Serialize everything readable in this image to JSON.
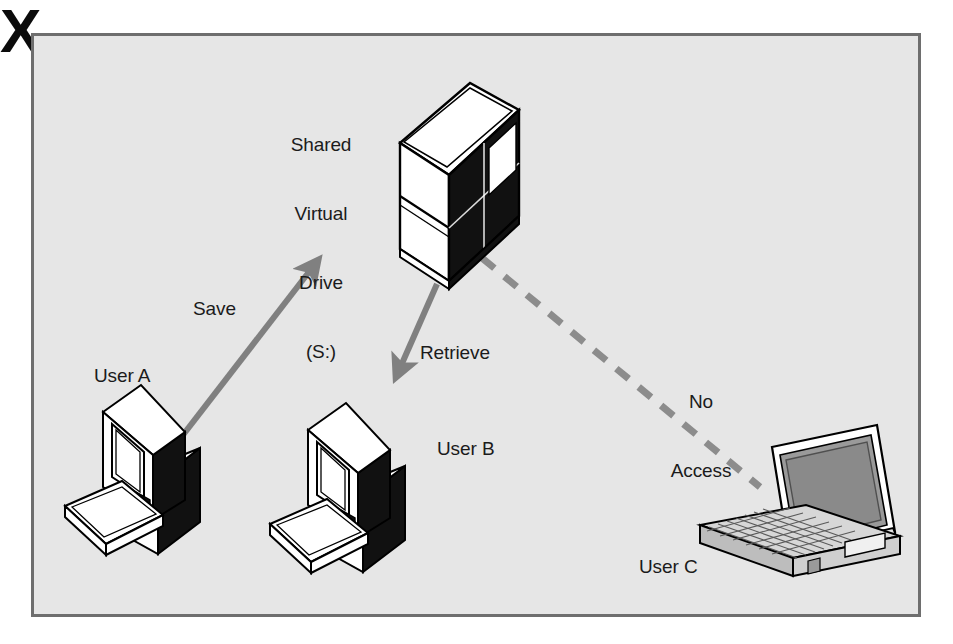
{
  "figure": {
    "background_color": "#e6e6e6",
    "border_color": "#6e6e6e",
    "page_color": "#ffffff",
    "arrow_color": "#808080",
    "dashed_color": "#8c8c8c",
    "text_color": "#1b1b1b",
    "block_color": "#000000"
  },
  "labels": {
    "drive": "Shared\nVirtual\nDrive\n(S:)",
    "drive_line1": "Shared",
    "drive_line2": "Virtual",
    "drive_line3": "Drive",
    "drive_line4": "(S:)",
    "save": "Save",
    "retrieve": "Retrieve",
    "user_a": "User A",
    "user_b": "User B",
    "user_c": "User C",
    "no_access": "No\nAccess",
    "no_access_line1": "No",
    "no_access_line2": "Access",
    "blocked_marker": "X"
  },
  "nodes": [
    {
      "id": "shared-drive",
      "name": "Shared Virtual Drive (S:)",
      "icon": "server-cabinet-icon",
      "x": 470,
      "y": 180
    },
    {
      "id": "user-a",
      "name": "User A",
      "icon": "desktop-computer-icon",
      "x": 160,
      "y": 500
    },
    {
      "id": "user-b",
      "name": "User B",
      "icon": "desktop-computer-icon",
      "x": 350,
      "y": 500
    },
    {
      "id": "user-c",
      "name": "User C",
      "icon": "laptop-computer-icon",
      "x": 800,
      "y": 510
    }
  ],
  "connections": [
    {
      "id": "save-arrow",
      "from": "user-a",
      "to": "shared-drive",
      "label": "Save",
      "style": "solid-arrow",
      "color": "#808080"
    },
    {
      "id": "retrieve-arrow",
      "from": "shared-drive",
      "to": "user-b",
      "label": "Retrieve",
      "style": "solid-arrow",
      "color": "#808080"
    },
    {
      "id": "no-access-link",
      "from": "shared-drive",
      "to": "user-c",
      "label": "No Access",
      "style": "dashed-blocked",
      "color": "#8c8c8c"
    }
  ]
}
